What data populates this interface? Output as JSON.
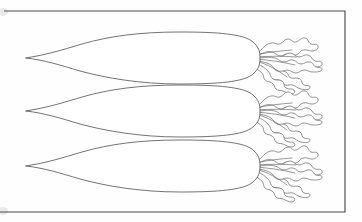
{
  "figure": {
    "title": "Three rooted vegetables with leafy tops",
    "kind": "botanical-line-drawing",
    "background_color": "#fefefe",
    "outline_color": "#5a5a5a",
    "frame_color": "#4c4c4c",
    "fill_color": "#ffffff",
    "subject_count": 3,
    "caption": ""
  },
  "frame": {
    "label": "plate-border",
    "x": 6,
    "y": 11,
    "width": 339,
    "height": 201
  },
  "specimens": [
    {
      "index": 1,
      "name": "root-vegetable-top",
      "label": "Specimen 1",
      "tip_x": 26,
      "tip_y": 58,
      "crown_x": 258,
      "crown_y": 58,
      "body_length": 232,
      "body_max_width": 47,
      "leaf_count": 5
    },
    {
      "index": 2,
      "name": "root-vegetable-middle",
      "label": "Specimen 2",
      "tip_x": 26,
      "tip_y": 111,
      "crown_x": 258,
      "crown_y": 111,
      "body_length": 232,
      "body_max_width": 47,
      "leaf_count": 5
    },
    {
      "index": 3,
      "name": "root-vegetable-bottom",
      "label": "Specimen 3",
      "tip_x": 26,
      "tip_y": 166,
      "crown_x": 258,
      "crown_y": 166,
      "body_length": 232,
      "body_max_width": 47,
      "leaf_count": 5
    }
  ],
  "leaf_geometry": {
    "description": "wavy lobed leaf blades radiating from the crown",
    "angles_degrees": [
      -34,
      -15,
      0,
      15,
      34
    ],
    "blade_length": 54
  }
}
